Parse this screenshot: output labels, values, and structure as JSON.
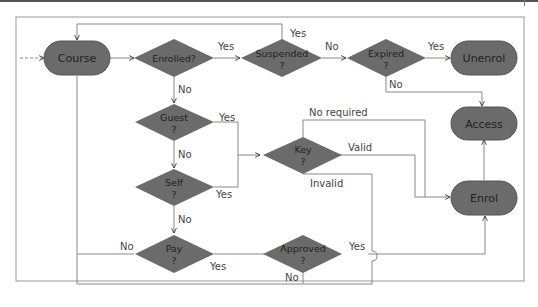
{
  "diagram": {
    "type": "flowchart",
    "colors": {
      "node_fill": "#6b6b6b",
      "line": "#888888",
      "frame": "#999999",
      "text": "#222222",
      "label": "#444444"
    },
    "terminals": {
      "course": "Course",
      "unenrol": "Unenrol",
      "access": "Access",
      "enrol": "Enrol"
    },
    "decisions": {
      "enrolled": {
        "line1": "Enrolled?",
        "line2": ""
      },
      "suspended": {
        "line1": "Suspended",
        "line2": "?"
      },
      "expired": {
        "line1": "Expired",
        "line2": "?"
      },
      "guest": {
        "line1": "Guest",
        "line2": "?"
      },
      "key": {
        "line1": "Key",
        "line2": "?"
      },
      "self": {
        "line1": "Self",
        "line2": "?"
      },
      "pay": {
        "line1": "Pay",
        "line2": "?"
      },
      "approved": {
        "line1": "Approved",
        "line2": "?"
      }
    },
    "edge_labels": {
      "enrolled_yes": "Yes",
      "suspended_yes": "Yes",
      "suspended_no": "No",
      "expired_yes": "Yes",
      "expired_no": "No",
      "enrolled_no": "No",
      "guest_yes": "Yes",
      "guest_no": "No",
      "key_no_required": "No required",
      "key_valid": "Valid",
      "key_invalid": "Invalid",
      "self_yes": "Yes",
      "self_no": "No",
      "pay_no": "No",
      "pay_yes": "Yes",
      "approved_yes": "Yes",
      "approved_no": "No"
    }
  }
}
